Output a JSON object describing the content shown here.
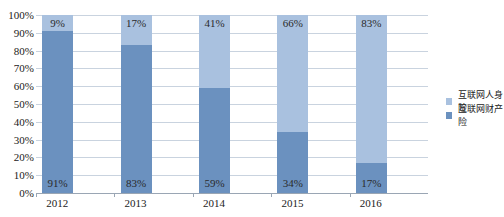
{
  "chart_data": {
    "type": "bar",
    "stacked": true,
    "title": "",
    "xlabel": "",
    "ylabel": "",
    "ylim": [
      0,
      100
    ],
    "yticks": [
      "0%",
      "10%",
      "20%",
      "30%",
      "40%",
      "50%",
      "60%",
      "70%",
      "80%",
      "90%",
      "100%"
    ],
    "categories": [
      "2012",
      "2013",
      "2014",
      "2015",
      "2016"
    ],
    "series": [
      {
        "name": "互联网财产险",
        "color": "#6b91bf",
        "values": [
          91,
          83,
          59,
          34,
          17
        ],
        "labels": [
          "91%",
          "83%",
          "59%",
          "34%",
          "17%"
        ]
      },
      {
        "name": "互联网人身险",
        "color": "#a9c1df",
        "values": [
          9,
          17,
          41,
          66,
          83
        ],
        "labels": [
          "9%",
          "17%",
          "41%",
          "66%",
          "83%"
        ]
      }
    ],
    "legend": {
      "position": "right",
      "entries": [
        "互联网人身险",
        "互联网财产险"
      ]
    },
    "grid": true
  }
}
